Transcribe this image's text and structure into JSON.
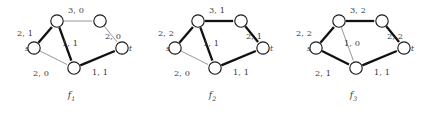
{
  "figure": {
    "colors": {
      "background": "#ffffff",
      "node_stroke": "#1a1a1a",
      "node_fill": "#ffffff",
      "edge_thin": "#8a8a8a",
      "edge_bold": "#111111",
      "text": "#3b3b3b"
    }
  },
  "graphs": [
    {
      "caption": "f",
      "caption_sub": "1",
      "nodes": [
        {
          "id": "s",
          "label": "s",
          "cx": 34,
          "cy": 48,
          "r": 6.2,
          "label_dx": -9,
          "label_dy": -4
        },
        {
          "id": "a",
          "label": "",
          "cx": 57,
          "cy": 21,
          "r": 6.2,
          "label_dx": 0,
          "label_dy": 0
        },
        {
          "id": "b",
          "label": "",
          "cx": 100,
          "cy": 21,
          "r": 6.2,
          "label_dx": 0,
          "label_dy": 0
        },
        {
          "id": "c",
          "label": "",
          "cx": 74,
          "cy": 68,
          "r": 6.2,
          "label_dx": 0,
          "label_dy": 0
        },
        {
          "id": "t",
          "label": "t",
          "cx": 122,
          "cy": 48,
          "r": 6.2,
          "label_dx": 7,
          "label_dy": -4
        }
      ],
      "edges": [
        {
          "from": "s",
          "to": "a",
          "label": "2, 1",
          "bold": true,
          "lx": 17,
          "ly": 28
        },
        {
          "from": "a",
          "to": "b",
          "label": "3, 0",
          "bold": false,
          "lx": 68,
          "ly": 5
        },
        {
          "from": "b",
          "to": "t",
          "label": "2, 0",
          "bold": false,
          "lx": 105,
          "ly": 31
        },
        {
          "from": "a",
          "to": "c",
          "label": "1, 1",
          "bold": true,
          "lx": 62,
          "ly": 38
        },
        {
          "from": "s",
          "to": "c",
          "label": "2, 0",
          "bold": false,
          "lx": 33,
          "ly": 68
        },
        {
          "from": "c",
          "to": "t",
          "label": "1, 1",
          "bold": true,
          "lx": 92,
          "ly": 67
        }
      ]
    },
    {
      "caption": "f",
      "caption_sub": "2",
      "nodes": [
        {
          "id": "s",
          "label": "s",
          "cx": 34,
          "cy": 48,
          "r": 6.2,
          "label_dx": -9,
          "label_dy": -4
        },
        {
          "id": "a",
          "label": "",
          "cx": 57,
          "cy": 21,
          "r": 6.2,
          "label_dx": 0,
          "label_dy": 0
        },
        {
          "id": "b",
          "label": "",
          "cx": 100,
          "cy": 21,
          "r": 6.2,
          "label_dx": 0,
          "label_dy": 0
        },
        {
          "id": "c",
          "label": "",
          "cx": 74,
          "cy": 68,
          "r": 6.2,
          "label_dx": 0,
          "label_dy": 0
        },
        {
          "id": "t",
          "label": "t",
          "cx": 122,
          "cy": 48,
          "r": 6.2,
          "label_dx": 7,
          "label_dy": -4
        }
      ],
      "edges": [
        {
          "from": "s",
          "to": "a",
          "label": "2, 2",
          "bold": true,
          "lx": 17,
          "ly": 28
        },
        {
          "from": "a",
          "to": "b",
          "label": "3, 1",
          "bold": true,
          "lx": 68,
          "ly": 5
        },
        {
          "from": "b",
          "to": "t",
          "label": "2, 1",
          "bold": true,
          "lx": 105,
          "ly": 31
        },
        {
          "from": "a",
          "to": "c",
          "label": "1, 1",
          "bold": true,
          "lx": 62,
          "ly": 38
        },
        {
          "from": "s",
          "to": "c",
          "label": "2, 0",
          "bold": false,
          "lx": 33,
          "ly": 68
        },
        {
          "from": "c",
          "to": "t",
          "label": "1, 1",
          "bold": true,
          "lx": 92,
          "ly": 67
        }
      ]
    },
    {
      "caption": "f",
      "caption_sub": "3",
      "nodes": [
        {
          "id": "s",
          "label": "s",
          "cx": 34,
          "cy": 48,
          "r": 6.2,
          "label_dx": -9,
          "label_dy": -4
        },
        {
          "id": "a",
          "label": "",
          "cx": 57,
          "cy": 21,
          "r": 6.2,
          "label_dx": 0,
          "label_dy": 0
        },
        {
          "id": "b",
          "label": "",
          "cx": 100,
          "cy": 21,
          "r": 6.2,
          "label_dx": 0,
          "label_dy": 0
        },
        {
          "id": "c",
          "label": "",
          "cx": 74,
          "cy": 68,
          "r": 6.2,
          "label_dx": 0,
          "label_dy": 0
        },
        {
          "id": "t",
          "label": "t",
          "cx": 122,
          "cy": 48,
          "r": 6.2,
          "label_dx": 7,
          "label_dy": -4
        }
      ],
      "edges": [
        {
          "from": "s",
          "to": "a",
          "label": "2, 2",
          "bold": true,
          "lx": 14,
          "ly": 28
        },
        {
          "from": "a",
          "to": "b",
          "label": "3, 2",
          "bold": true,
          "lx": 68,
          "ly": 5
        },
        {
          "from": "b",
          "to": "t",
          "label": "2, 2",
          "bold": true,
          "lx": 105,
          "ly": 31
        },
        {
          "from": "a",
          "to": "c",
          "label": "1, 0",
          "bold": false,
          "lx": 62,
          "ly": 38
        },
        {
          "from": "s",
          "to": "c",
          "label": "2, 1",
          "bold": true,
          "lx": 33,
          "ly": 68
        },
        {
          "from": "c",
          "to": "t",
          "label": "1, 1",
          "bold": true,
          "lx": 92,
          "ly": 67
        }
      ]
    }
  ],
  "panel_offsets": [
    0,
    141,
    282
  ],
  "caption_y": 90
}
